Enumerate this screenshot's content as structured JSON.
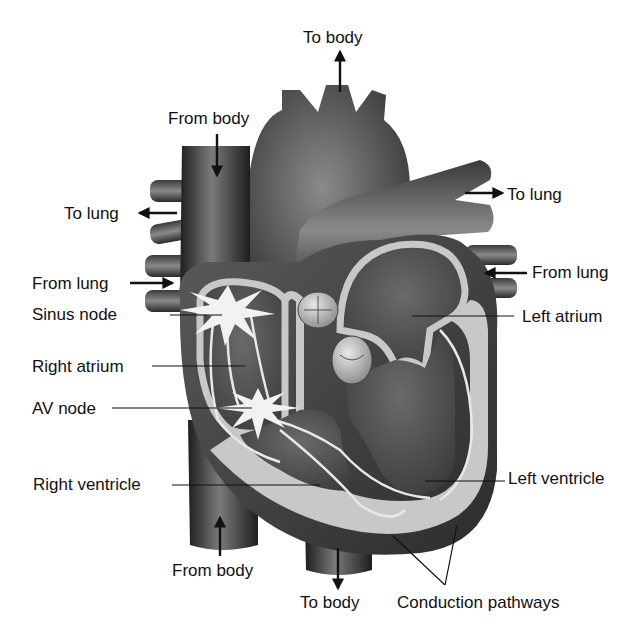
{
  "diagram": {
    "type": "anatomical-illustration",
    "style": "grayscale",
    "colors": {
      "background": "#ffffff",
      "vessel_dark": "#2e2e2e",
      "vessel_mid": "#6a6a6a",
      "chamber": "#505050",
      "wall_light": "#c8c8c8",
      "node_highlight": "#f2f2f2",
      "text": "#111111"
    }
  },
  "labels": {
    "top_to_body": "To body",
    "from_body_top": "From body",
    "to_lung_left": "To lung",
    "to_lung_right": "To lung",
    "from_lung_left": "From lung",
    "from_lung_right": "From lung",
    "sinus_node": "Sinus node",
    "left_atrium": "Left atrium",
    "right_atrium": "Right atrium",
    "av_node": "AV node",
    "right_ventricle": "Right ventricle",
    "left_ventricle": "Left ventricle",
    "from_body_bottom": "From body",
    "bottom_to_body": "To body",
    "conduction_pathways": "Conduction pathways"
  },
  "flow_arrows": [
    {
      "label": "To body",
      "direction": "up",
      "location": "aorta top"
    },
    {
      "label": "From body",
      "direction": "down",
      "location": "superior vena cava"
    },
    {
      "label": "To lung",
      "direction": "left",
      "location": "right pulmonary artery"
    },
    {
      "label": "To lung",
      "direction": "right",
      "location": "left pulmonary artery"
    },
    {
      "label": "From lung",
      "direction": "right",
      "location": "right pulmonary veins"
    },
    {
      "label": "From lung",
      "direction": "left",
      "location": "left pulmonary veins"
    },
    {
      "label": "From body",
      "direction": "up",
      "location": "inferior vena cava"
    },
    {
      "label": "To body",
      "direction": "down",
      "location": "descending aorta"
    }
  ]
}
